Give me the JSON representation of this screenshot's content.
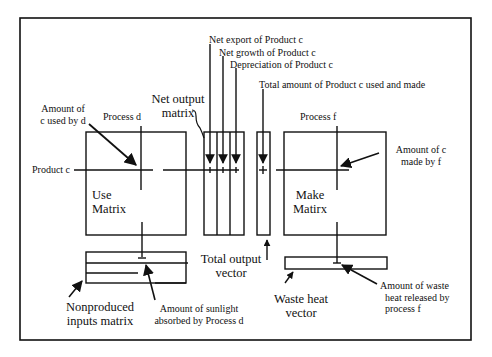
{
  "diagram": {
    "type": "matrix-flow-diagram",
    "matrices": {
      "use_matrix": [
        "Use",
        "Matrix"
      ],
      "make_matrix": [
        "Make",
        "Matirx"
      ],
      "net_output_matrix": [
        "Net output",
        "matrix"
      ],
      "total_output_vector": [
        "Total output",
        "vector"
      ],
      "nonproduced_inputs_matrix": [
        "Nonproduced",
        "inputs matrix"
      ],
      "waste_heat_vector": [
        "Waste heat",
        "vector"
      ]
    },
    "axis_labels": {
      "process_d": "Process d",
      "process_f": "Process f",
      "product_c": "Product c"
    },
    "net_output_components": [
      "Net export of Product c",
      "Net growth of Product c",
      "Depreciation of Product c"
    ],
    "annotations": {
      "total_amount": "Total amount of Product c used and made",
      "amount_used": [
        "Amount of",
        "c used by d"
      ],
      "amount_made": [
        "Amount of c",
        "made by f"
      ],
      "sunlight": [
        "Amount of sunlight",
        "absorbed by Process d"
      ],
      "waste_heat": [
        "Amount of waste",
        "heat released by",
        "process f"
      ]
    }
  }
}
